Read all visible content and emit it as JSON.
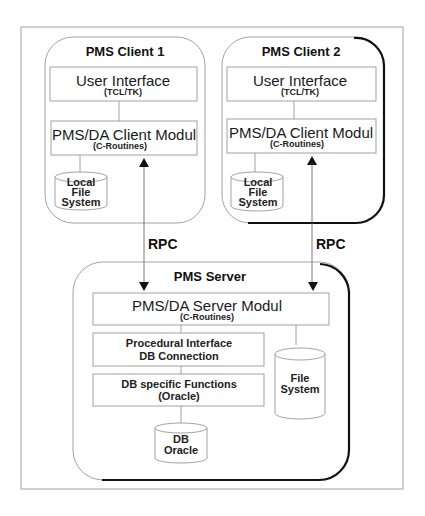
{
  "diagram": {
    "clients": [
      {
        "title": "PMS Client 1",
        "ui": {
          "label": "User Interface",
          "sub": "(TCL/TK)"
        },
        "modul": {
          "label": "PMS/DA Client Modul",
          "sub": "(C-Routines)"
        },
        "storage": {
          "lines": [
            "Local",
            "File",
            "System"
          ]
        }
      },
      {
        "title": "PMS Client 2",
        "ui": {
          "label": "User Interface",
          "sub": "(TCL/TK)"
        },
        "modul": {
          "label": "PMS/DA Client Modul",
          "sub": "(C-Routines)"
        },
        "storage": {
          "lines": [
            "Local",
            "File",
            "System"
          ]
        }
      }
    ],
    "connections": [
      {
        "label": "RPC"
      },
      {
        "label": "RPC"
      }
    ],
    "server": {
      "title": "PMS Server",
      "modul": {
        "label": "PMS/DA Server Modul",
        "sub": "(C-Routines)"
      },
      "procedural": {
        "lines": [
          "Procedural Interface",
          "DB Connection"
        ]
      },
      "db_functions": {
        "lines": [
          "DB specific Functions",
          "(Oracle)"
        ]
      },
      "file_system": {
        "lines": [
          "File",
          "System"
        ]
      },
      "database": {
        "lines": [
          "DB",
          "Oracle"
        ]
      }
    }
  }
}
